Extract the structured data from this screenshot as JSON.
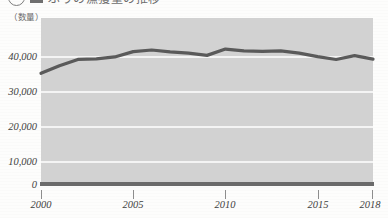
{
  "heading": {
    "marker": "1",
    "text": "ぶりの漁獲量の推移",
    "visible_note": "cut-off at top edge"
  },
  "unit_label": "（数量）",
  "chart_data": {
    "type": "line",
    "title": "",
    "xlabel": "",
    "ylabel": "",
    "unit": "（数量）",
    "ylim": [
      0,
      48000
    ],
    "yticks": [
      0,
      10000,
      20000,
      30000,
      40000
    ],
    "ytick_labels": [
      "0",
      "10,000",
      "20,000",
      "30,000",
      "40,000"
    ],
    "xlim": [
      2000,
      2018
    ],
    "xticks": [
      2000,
      2005,
      2010,
      2015,
      2018
    ],
    "xtick_labels": [
      "2000",
      "2005",
      "2010",
      "2015",
      "2018"
    ],
    "grid": true,
    "legend": "none",
    "line_color": "#5a5a5a",
    "plot_background": "#d2d2d2",
    "gridline_color": "#f4f4f4",
    "series": [
      {
        "name": "漁獲量",
        "x": [
          2000,
          2001,
          2002,
          2003,
          2004,
          2005,
          2006,
          2007,
          2008,
          2009,
          2010,
          2011,
          2012,
          2013,
          2014,
          2015,
          2016,
          2017,
          2018
        ],
        "values": [
          34500,
          36900,
          38900,
          39100,
          39700,
          41400,
          41900,
          41300,
          40900,
          40200,
          42200,
          41600,
          41500,
          41600,
          40900,
          39800,
          38900,
          40100,
          39000
        ]
      }
    ]
  }
}
